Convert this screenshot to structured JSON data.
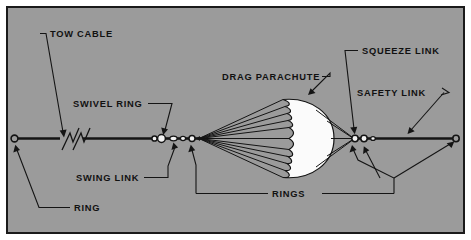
{
  "figure": {
    "background_color": "#9b9b9b",
    "border_color": "#1a1a1a",
    "page_color": "#ffffff",
    "line_color": "#141414",
    "canopy_color": "#fbfbfb"
  },
  "labels": {
    "tow_cable": "TOW CABLE",
    "swivel_ring": "SWIVEL RING",
    "swing_link": "SWING LINK",
    "ring": "RING",
    "drag_parachute": "DRAG PARACHUTE",
    "squeeze_link": "SQUEEZE LINK",
    "safety_link": "SAFETY LINK",
    "rings": "RINGS"
  },
  "components": {
    "left_end_ring": "ring",
    "cable_break_symbol": "break-mark",
    "swivel_ring": "swivel-ring",
    "swing_link": "swing-link",
    "forward_ring": "ring",
    "suspension_line_count": 11,
    "canopy_gore_count": 10,
    "squeeze_link": "squeeze-link",
    "safety_link": "safety-link",
    "right_end_ring": "ring"
  }
}
